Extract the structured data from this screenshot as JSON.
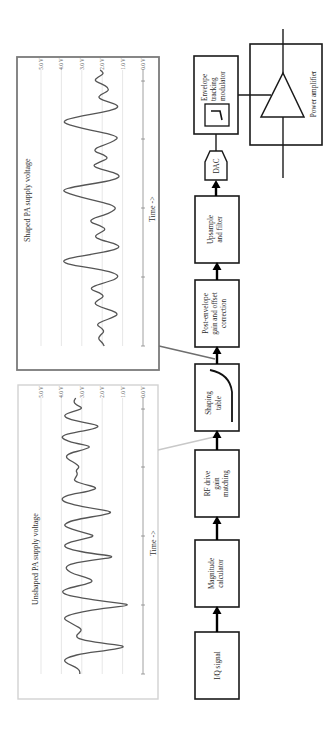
{
  "figure": {
    "orientation": "rotated 90 degrees counter-clockwise",
    "blocks": [
      {
        "id": "iq",
        "lines": [
          "I/Q signal"
        ]
      },
      {
        "id": "magnitude",
        "lines": [
          "Magnitude",
          "calculator"
        ]
      },
      {
        "id": "rf-drive",
        "lines": [
          "RF drive",
          "gain",
          "matching"
        ]
      },
      {
        "id": "shaping",
        "lines": [
          "Shaping",
          "table"
        ]
      },
      {
        "id": "post-envelope",
        "lines": [
          "Post-envelope",
          "gain and offset",
          "correction"
        ]
      },
      {
        "id": "upsample",
        "lines": [
          "Upsample",
          "and filter"
        ]
      },
      {
        "id": "dac",
        "lines": [
          "DAC"
        ]
      },
      {
        "id": "et-modulator",
        "lines": [
          "Envelope",
          "tracking",
          "modulator"
        ]
      },
      {
        "id": "pa",
        "lines": [
          "Power amplifier"
        ]
      }
    ]
  },
  "chart_data": [
    {
      "type": "line",
      "title": "Shaped PA supply voltage",
      "xlabel": "Time ->",
      "ylabel": "",
      "ylim": [
        0,
        5
      ],
      "yticks": [
        "0.0 V",
        "1.0 V",
        "2.0 V",
        "3.0 V",
        "4.0 V",
        "5.0 V"
      ],
      "grid": true,
      "border": "dark",
      "series": [
        {
          "name": "shaped",
          "values": [
            1.9,
            2.0,
            2.2,
            2.1,
            1.9,
            2.0,
            2.3,
            2.0,
            1.5,
            1.2,
            1.5,
            2.1,
            2.4,
            2.2,
            1.9,
            2.1,
            2.6,
            2.4,
            1.8,
            1.3,
            1.2,
            1.6,
            2.5,
            3.6,
            4.0,
            3.5,
            2.4,
            1.5,
            1.1,
            1.4,
            2.1,
            2.4,
            2.1,
            1.8,
            2.1,
            2.6,
            2.5,
            1.9,
            1.5,
            1.3,
            1.6,
            2.3,
            3.0,
            3.6,
            4.0,
            3.4,
            2.3,
            1.4,
            1.1,
            1.4,
            2.1,
            2.5,
            2.1,
            1.7,
            1.9,
            2.4,
            2.3,
            1.8,
            1.4,
            1.2,
            1.7,
            2.6,
            3.3,
            3.9,
            3.8,
            3.0,
            2.0,
            1.3,
            1.2,
            1.7,
            2.2,
            2.1,
            1.7,
            1.7,
            2.0,
            2.4,
            2.2,
            1.9,
            2.1
          ]
        }
      ]
    },
    {
      "type": "line",
      "title": "Unshaped PA supply voltage",
      "xlabel": "Time ->",
      "ylabel": "",
      "ylim": [
        0,
        5
      ],
      "yticks": [
        "0.0 V",
        "1.0 V",
        "2.0 V",
        "3.0 V",
        "4.0 V",
        "5.0 V"
      ],
      "grid": true,
      "border": "light",
      "series": [
        {
          "name": "unshaped",
          "values": [
            3.1,
            3.1,
            3.3,
            3.7,
            3.9,
            3.6,
            2.9,
            1.6,
            0.7,
            2.1,
            3.1,
            3.3,
            3.1,
            3.0,
            3.3,
            3.6,
            3.9,
            3.7,
            3.0,
            2.0,
            0.4,
            1.8,
            3.0,
            3.8,
            4.0,
            3.6,
            2.8,
            2.4,
            2.8,
            3.4,
            3.7,
            3.8,
            3.5,
            2.5,
            1.2,
            2.6,
            3.5,
            3.9,
            3.7,
            3.0,
            2.3,
            2.9,
            3.5,
            3.9,
            3.7,
            3.1,
            2.0,
            1.4,
            2.5,
            3.4,
            3.9,
            4.0,
            3.6,
            2.6,
            2.2,
            2.9,
            3.4,
            3.3,
            3.2,
            3.3,
            3.1,
            3.3,
            3.6,
            3.8,
            3.6,
            2.9,
            2.5,
            3.4,
            3.9,
            4.0,
            3.4,
            2.4,
            2.1,
            3.0,
            3.7,
            3.9,
            3.5,
            2.9,
            3.3,
            3.4,
            3.3
          ]
        }
      ]
    }
  ]
}
